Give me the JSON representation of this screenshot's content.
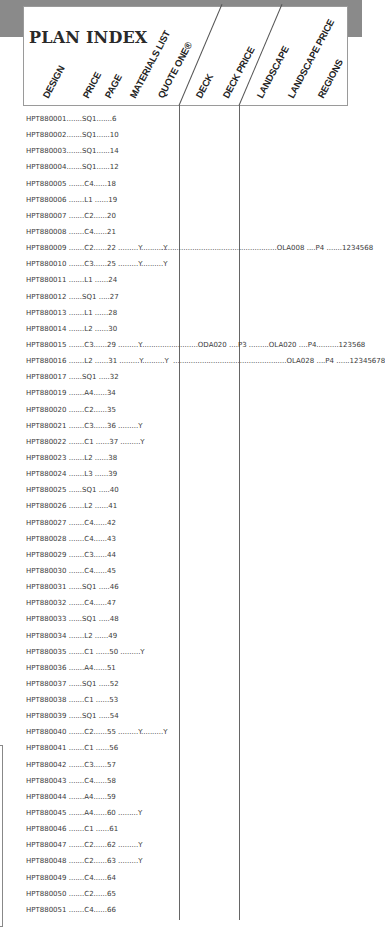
{
  "title": "PLAN INDEX",
  "columns": [
    "DESIGN",
    "PRICE",
    "PAGE",
    "MATERIALS LIST",
    "QUOTE ONE®",
    "DECK",
    "DECK PRICE",
    "LANDSCAPE",
    "LANDSCAPE PRICE",
    "REGIONS"
  ],
  "rows": [
    {
      "text": "HPT880001.......SQ1.......6",
      "extra": ""
    },
    {
      "text": "HPT880002.......SQ1......10",
      "extra": ""
    },
    {
      "text": "HPT880003.......SQ1......14",
      "extra": ""
    },
    {
      "text": "HPT880004.......SQ1......12",
      "extra": ""
    },
    {
      "text": "HPT880005 .......C4......18",
      "extra": ""
    },
    {
      "text": "HPT880006 .......L1 ......19",
      "extra": ""
    },
    {
      "text": "HPT880007 .......C2......20",
      "extra": ""
    },
    {
      "text": "HPT880008 .......C4......21",
      "extra": ""
    },
    {
      "text": "HPT880009 .......C2......22 .........Y..........Y",
      "extra": "....................................................OLA008 ....P4 .......1234568"
    },
    {
      "text": "HPT880010 .......C3......25 .........Y..........Y",
      "extra": ""
    },
    {
      "text": "HPT880011 .......L1 ......24",
      "extra": ""
    },
    {
      "text": "HPT880012 ......SQ1 .....27",
      "extra": ""
    },
    {
      "text": "HPT880013 .......L1 ......28",
      "extra": ""
    },
    {
      "text": "HPT880014 .......L2 ......30",
      "extra": ""
    },
    {
      "text": "HPT880015 .......C3......29 .........Y",
      "extra": "..........................ODA020 ....P3 .........OLA020 ....P4..........123568"
    },
    {
      "text": "HPT880016 .......L2 ......31 .........Y..........Y",
      "extra": "...................................................OLA028 ....P4 ......12345678"
    },
    {
      "text": "HPT880017 ......SQ1 .....32",
      "extra": ""
    },
    {
      "text": "HPT880019 .......A4......34",
      "extra": ""
    },
    {
      "text": "HPT880020 .......C2......35",
      "extra": ""
    },
    {
      "text": "HPT880021 .......C3......36 .........Y",
      "extra": ""
    },
    {
      "text": "HPT880022 .......C1 ......37 .........Y",
      "extra": ""
    },
    {
      "text": "HPT880023 .......L2 ......38",
      "extra": ""
    },
    {
      "text": "HPT880024 .......L3 ......39",
      "extra": ""
    },
    {
      "text": "HPT880025 ......SQ1 .....40",
      "extra": ""
    },
    {
      "text": "HPT880026 .......L2 ......41",
      "extra": ""
    },
    {
      "text": "HPT880027 .......C4......42",
      "extra": ""
    },
    {
      "text": "HPT880028 .......C4......43",
      "extra": ""
    },
    {
      "text": "HPT880029 .......C3......44",
      "extra": ""
    },
    {
      "text": "HPT880030 .......C4......45",
      "extra": ""
    },
    {
      "text": "HPT880031 ......SQ1 .....46",
      "extra": ""
    },
    {
      "text": "HPT880032 .......C4......47",
      "extra": ""
    },
    {
      "text": "HPT880033 ......SQ1 .....48",
      "extra": ""
    },
    {
      "text": "HPT880034 .......L2 ......49",
      "extra": ""
    },
    {
      "text": "HPT880035 .......C1 ......50 .........Y",
      "extra": ""
    },
    {
      "text": "HPT880036 .......A4......51",
      "extra": ""
    },
    {
      "text": "HPT880037 ......SQ1 .....52",
      "extra": ""
    },
    {
      "text": "HPT880038 .......C1 ......53",
      "extra": ""
    },
    {
      "text": "HPT880039 ......SQ1 .....54",
      "extra": ""
    },
    {
      "text": "HPT880040 .......C2......55 .........Y..........Y",
      "extra": ""
    },
    {
      "text": "HPT880041 .......C1 ......56",
      "extra": ""
    },
    {
      "text": "HPT880042 .......C3......57",
      "extra": ""
    },
    {
      "text": "HPT880043 .......C4......58",
      "extra": ""
    },
    {
      "text": "HPT880044 .......A4......59",
      "extra": ""
    },
    {
      "text": "HPT880045 .......A4......60 .........Y",
      "extra": ""
    },
    {
      "text": "HPT880046 .......C1 ......61",
      "extra": ""
    },
    {
      "text": "HPT880047 .......C2......62 .........Y",
      "extra": ""
    },
    {
      "text": "HPT880048 .......C2......63 .........Y",
      "extra": ""
    },
    {
      "text": "HPT880049 .......C4......64",
      "extra": ""
    },
    {
      "text": "HPT880050 .......C2......65",
      "extra": ""
    },
    {
      "text": "HPT880051 .......C4......66",
      "extra": ""
    }
  ]
}
